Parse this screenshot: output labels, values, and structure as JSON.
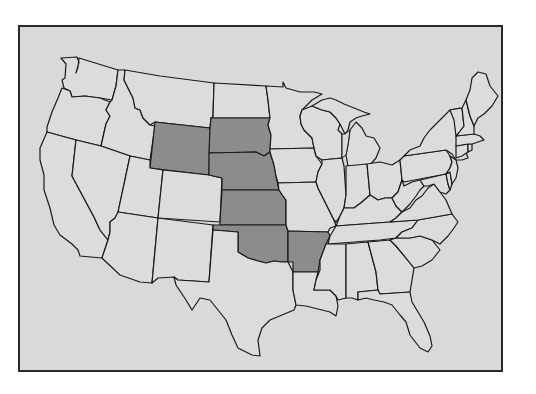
{
  "map": {
    "title": "",
    "region": "Contiguous United States",
    "colors": {
      "background": "#d9d9d9",
      "frame_border": "#2a2a2a",
      "state_default": "#dcdcdc",
      "state_highlighted": "#8c8c8c",
      "state_border": "#1a1a1a"
    },
    "highlighted_states": [
      "Wyoming",
      "South Dakota",
      "Nebraska",
      "Kansas",
      "Oklahoma",
      "Arkansas"
    ],
    "states": [
      {
        "name": "Washington",
        "highlighted": false
      },
      {
        "name": "Oregon",
        "highlighted": false
      },
      {
        "name": "California",
        "highlighted": false
      },
      {
        "name": "Idaho",
        "highlighted": false
      },
      {
        "name": "Nevada",
        "highlighted": false
      },
      {
        "name": "Montana",
        "highlighted": false
      },
      {
        "name": "Wyoming",
        "highlighted": true
      },
      {
        "name": "Utah",
        "highlighted": false
      },
      {
        "name": "Arizona",
        "highlighted": false
      },
      {
        "name": "Colorado",
        "highlighted": false
      },
      {
        "name": "New Mexico",
        "highlighted": false
      },
      {
        "name": "North Dakota",
        "highlighted": false
      },
      {
        "name": "South Dakota",
        "highlighted": true
      },
      {
        "name": "Nebraska",
        "highlighted": true
      },
      {
        "name": "Kansas",
        "highlighted": true
      },
      {
        "name": "Oklahoma",
        "highlighted": true
      },
      {
        "name": "Texas",
        "highlighted": false
      },
      {
        "name": "Minnesota",
        "highlighted": false
      },
      {
        "name": "Iowa",
        "highlighted": false
      },
      {
        "name": "Missouri",
        "highlighted": false
      },
      {
        "name": "Arkansas",
        "highlighted": true
      },
      {
        "name": "Louisiana",
        "highlighted": false
      },
      {
        "name": "Wisconsin",
        "highlighted": false
      },
      {
        "name": "Illinois",
        "highlighted": false
      },
      {
        "name": "Michigan",
        "highlighted": false
      },
      {
        "name": "Indiana",
        "highlighted": false
      },
      {
        "name": "Ohio",
        "highlighted": false
      },
      {
        "name": "Kentucky",
        "highlighted": false
      },
      {
        "name": "Tennessee",
        "highlighted": false
      },
      {
        "name": "Mississippi",
        "highlighted": false
      },
      {
        "name": "Alabama",
        "highlighted": false
      },
      {
        "name": "Georgia",
        "highlighted": false
      },
      {
        "name": "Florida",
        "highlighted": false
      },
      {
        "name": "South Carolina",
        "highlighted": false
      },
      {
        "name": "North Carolina",
        "highlighted": false
      },
      {
        "name": "Virginia",
        "highlighted": false
      },
      {
        "name": "West Virginia",
        "highlighted": false
      },
      {
        "name": "Pennsylvania",
        "highlighted": false
      },
      {
        "name": "New York",
        "highlighted": false
      },
      {
        "name": "Maryland",
        "highlighted": false
      },
      {
        "name": "Delaware",
        "highlighted": false
      },
      {
        "name": "New Jersey",
        "highlighted": false
      },
      {
        "name": "Connecticut",
        "highlighted": false
      },
      {
        "name": "Rhode Island",
        "highlighted": false
      },
      {
        "name": "Massachusetts",
        "highlighted": false
      },
      {
        "name": "Vermont",
        "highlighted": false
      },
      {
        "name": "New Hampshire",
        "highlighted": false
      },
      {
        "name": "Maine",
        "highlighted": false
      }
    ]
  }
}
